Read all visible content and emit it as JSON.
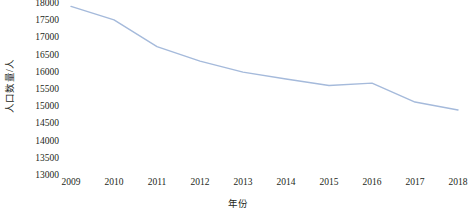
{
  "chart_data": {
    "type": "line",
    "title": "",
    "subtitle": "",
    "xlabel": "年份",
    "ylabel": "人口数量/人",
    "categories": [
      "2009",
      "2010",
      "2011",
      "2012",
      "2013",
      "2014",
      "2015",
      "2016",
      "2017",
      "2018"
    ],
    "x": [
      2009,
      2010,
      2011,
      2012,
      2013,
      2014,
      2015,
      2016,
      2017,
      2018
    ],
    "series": [
      {
        "name": "人口数量",
        "color": "#a5badb",
        "values": [
          17930,
          17540,
          16760,
          16340,
          16020,
          15820,
          15630,
          15700,
          15150,
          14920
        ]
      }
    ],
    "values": [
      17930,
      17540,
      16760,
      16340,
      16020,
      15820,
      15630,
      15700,
      15150,
      14920
    ],
    "ylim": [
      13000,
      18000
    ],
    "ytick_values": [
      13000,
      13500,
      14000,
      14500,
      15000,
      15500,
      16000,
      16500,
      17000,
      17500,
      18000
    ],
    "ytick_labels": [
      "13000",
      "13500",
      "14000",
      "14500",
      "15000",
      "15500",
      "16000",
      "16500",
      "17000",
      "17500",
      "18000"
    ],
    "xtick_labels": [
      "2009",
      "2010",
      "2011",
      "2012",
      "2013",
      "2014",
      "2015",
      "2016",
      "2017",
      "2018"
    ],
    "grid": false,
    "legend": false,
    "legend_position": "none",
    "markers": false,
    "line_width": 1.4
  },
  "axes": {
    "y_title": "人口数量/人",
    "x_title": "年份"
  }
}
